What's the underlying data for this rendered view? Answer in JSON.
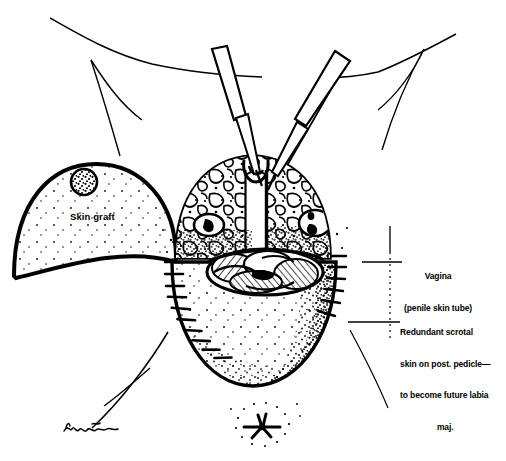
{
  "figure": {
    "ink_color": "#000000",
    "background_color": "#ffffff"
  },
  "labels": {
    "skin_graft": {
      "text": "Skin graft"
    },
    "vagina": {
      "line1": "Vagina",
      "line2": "(penile skin tube)"
    },
    "redundant": {
      "line1": "Redundant scrotal",
      "line2": "skin on post. pedicle—",
      "line3": "to become future labia",
      "line4": "maj."
    }
  },
  "signature": {
    "text": "artist signature"
  },
  "structures": {
    "forceps_left": "surgical forceps grasping tissue at upper left of field",
    "forceps_right": "surgical forceps grasping tissue at upper right of field",
    "upper_dome": "stippled mottled tissue dome superior to neovaginal opening",
    "penile_skin_tube_band": "pale vertical band running down midline of dome",
    "oval_left": "oval retracted tissue structure on left of dome",
    "oval_right": "oval retracted tissue structure on right of dome",
    "neovaginal_opening": "elliptical crosshatched introitus at midline",
    "lower_flap": "stippled redundant scrotal skin flap with suture line along left margin",
    "anus": "stellate anal opening at inferior midline",
    "thigh_creases": "thin curved groin and thigh crease lines"
  }
}
